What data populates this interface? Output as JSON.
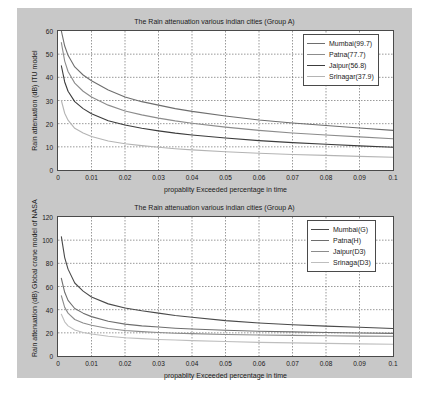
{
  "figure": {
    "background_color": "#c8c8c8",
    "axes_background": "#ffffff",
    "frame_color": "#4a4a4a"
  },
  "chart_data": [
    {
      "type": "line",
      "id": "itu-model",
      "title": "The Rain attenuation various  indian cities (Group A)",
      "xlabel": "propablity Exceeded percentage in time",
      "ylabel": "Rain attenuation (dB)  ITU model",
      "xlim": [
        0,
        0.1
      ],
      "ylim": [
        0,
        60
      ],
      "xticks": [
        "0",
        "0.01",
        "0.02",
        "0.03",
        "0.04",
        "0.05",
        "0.06",
        "0.07",
        "0.08",
        "0.09",
        "0.1"
      ],
      "xtick_values": [
        0,
        0.01,
        0.02,
        0.03,
        0.04,
        0.05,
        0.06,
        0.07,
        0.08,
        0.09,
        0.1
      ],
      "yticks": [
        "0",
        "10",
        "20",
        "30",
        "40",
        "50",
        "60"
      ],
      "ytick_values": [
        0,
        10,
        20,
        30,
        40,
        50,
        60
      ],
      "grid": true,
      "grid_style": "dotted",
      "legend_position": "upper right",
      "x": [
        0.001,
        0.002,
        0.003,
        0.005,
        0.0075,
        0.01,
        0.015,
        0.02,
        0.025,
        0.03,
        0.035,
        0.04,
        0.05,
        0.06,
        0.07,
        0.08,
        0.09,
        0.1
      ],
      "series": [
        {
          "name": "Mumbai(99.7)",
          "color": "#6e6e6e",
          "values": [
            60.0,
            53.5,
            49.5,
            44.5,
            41.0,
            38.5,
            34.5,
            31.5,
            29.5,
            28.0,
            26.5,
            25.3,
            23.3,
            21.6,
            20.3,
            19.2,
            18.1,
            17.1
          ]
        },
        {
          "name": "Patna(77.7)",
          "color": "#8c8c8c",
          "values": [
            55.0,
            47.0,
            42.5,
            37.5,
            34.0,
            31.5,
            28.0,
            25.5,
            23.8,
            22.4,
            21.2,
            20.2,
            18.5,
            17.1,
            16.0,
            15.1,
            14.3,
            13.5
          ]
        },
        {
          "name": "Jaipur(56.8)",
          "color": "#3c3c3c",
          "values": [
            45.0,
            38.0,
            34.0,
            29.5,
            26.5,
            24.3,
            21.3,
            19.4,
            18.0,
            16.9,
            15.9,
            15.1,
            13.8,
            12.7,
            11.8,
            11.1,
            10.4,
            9.8
          ]
        },
        {
          "name": "Srinagar(37.9)",
          "color": "#b4b4b4",
          "values": [
            30.0,
            24.5,
            21.5,
            18.0,
            16.0,
            14.5,
            12.5,
            11.3,
            10.5,
            9.8,
            9.2,
            8.7,
            7.9,
            7.2,
            6.7,
            6.3,
            5.9,
            5.5
          ]
        }
      ]
    },
    {
      "type": "line",
      "id": "crane-model",
      "title": "The Rain attenuation various  indian cities (Group  A)",
      "xlabel": "propablity Exceeded percentage in time",
      "ylabel": "Rain attenuation (dB) Global crane model of NASA",
      "xlim": [
        0,
        0.1
      ],
      "ylim": [
        0,
        120
      ],
      "xticks": [
        "0",
        "0.01",
        "0.02",
        "0.03",
        "0.04",
        "0.05",
        "0.06",
        "0.07",
        "0.08",
        "0.09",
        "0.1"
      ],
      "xtick_values": [
        0,
        0.01,
        0.02,
        0.03,
        0.04,
        0.05,
        0.06,
        0.07,
        0.08,
        0.09,
        0.1
      ],
      "yticks": [
        "0",
        "20",
        "40",
        "60",
        "80",
        "100",
        "120"
      ],
      "ytick_values": [
        0,
        20,
        40,
        60,
        80,
        100,
        120
      ],
      "grid": true,
      "grid_style": "dotted",
      "legend_position": "upper right",
      "x": [
        0.001,
        0.002,
        0.003,
        0.005,
        0.0075,
        0.01,
        0.015,
        0.02,
        0.025,
        0.03,
        0.035,
        0.04,
        0.05,
        0.06,
        0.07,
        0.08,
        0.09,
        0.1
      ],
      "series": [
        {
          "name": "Mumbai(G)",
          "color": "#4a4a4a",
          "values": [
            103.0,
            85.0,
            75.0,
            63.0,
            56.0,
            51.0,
            45.0,
            41.5,
            39.0,
            37.0,
            35.0,
            33.5,
            30.5,
            28.5,
            27.0,
            25.8,
            24.8,
            23.8
          ]
        },
        {
          "name": "Patna(H)",
          "color": "#6e6e6e",
          "values": [
            67.0,
            55.0,
            48.0,
            41.0,
            37.0,
            34.0,
            30.0,
            27.5,
            26.0,
            25.0,
            24.0,
            23.3,
            22.2,
            21.4,
            20.8,
            20.3,
            19.9,
            19.5
          ]
        },
        {
          "name": "Jaipur(D3)",
          "color": "#8c8c8c",
          "values": [
            52.0,
            42.0,
            37.0,
            31.5,
            28.5,
            26.5,
            23.8,
            22.0,
            21.0,
            20.3,
            19.7,
            19.3,
            18.6,
            18.1,
            17.8,
            17.5,
            17.2,
            17.0
          ]
        },
        {
          "name": "Srinaga(D3)",
          "color": "#bebebe",
          "values": [
            36.0,
            29.5,
            26.0,
            22.5,
            20.3,
            19.0,
            17.0,
            15.8,
            15.0,
            14.3,
            13.8,
            13.3,
            12.5,
            11.8,
            11.3,
            10.9,
            10.5,
            10.2
          ]
        }
      ]
    }
  ]
}
